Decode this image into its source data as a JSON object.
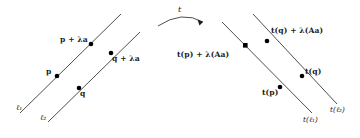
{
  "figure": {
    "stroke_color": "#3a3a3a",
    "point_color": "#000000",
    "text_color": "#1a1a1a",
    "background": "#ffffff",
    "map_label": "t",
    "left_panel": {
      "line_labels": [
        {
          "name": "line-1-label",
          "text": "ℓ₁"
        },
        {
          "name": "line-2-label",
          "text": "ℓ₂"
        }
      ],
      "point_labels": [
        {
          "name": "point-p-label",
          "text": "p"
        },
        {
          "name": "point-q-label",
          "text": "q"
        },
        {
          "name": "point-p-plus-lambda-a-label",
          "text": "p + λa"
        },
        {
          "name": "point-q-plus-lambda-a-label",
          "text": "q + λa"
        }
      ]
    },
    "right_panel": {
      "line_labels": [
        {
          "name": "image-line-1-label",
          "text": "t(ℓ₁)"
        },
        {
          "name": "image-line-2-label",
          "text": "t(ℓ₂)"
        }
      ],
      "point_labels": [
        {
          "name": "image-point-tp-label",
          "text": "t(p)"
        },
        {
          "name": "image-point-tq-label",
          "text": "t(q)"
        },
        {
          "name": "image-point-tp-plus-lambda-Aa-label",
          "text": "t(p) + λ(Aa)"
        },
        {
          "name": "image-point-tq-plus-lambda-Aa-label",
          "text": "t(q) + λ(Aa)"
        }
      ]
    }
  }
}
